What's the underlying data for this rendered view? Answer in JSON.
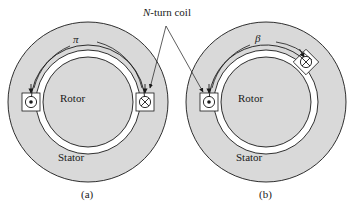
{
  "figure": {
    "type": "engineering-cross-section-diagram",
    "background_color": "#ffffff",
    "line_color": "#1a1a1a",
    "iron_fill_color": "#d9d9d9",
    "airgap_fill_color": "#ffffff"
  },
  "annotation": {
    "coil_label_prefix": "N",
    "coil_label_suffix": "-turn coil",
    "coil_label_full": "N-turn coil",
    "leader_apex": {
      "x": 166,
      "y": 26
    },
    "leader_targets": [
      {
        "x": 140,
        "y": 84,
        "panel": "a",
        "terminal": "cross"
      },
      {
        "x": 198,
        "y": 86,
        "panel": "b",
        "terminal": "dot"
      }
    ]
  },
  "panels": [
    {
      "id": "a",
      "caption": "(a)",
      "center": {
        "x": 88,
        "y": 102
      },
      "stator_outer_radius": 80,
      "stator_label": "Stator",
      "rotor_label": "Rotor",
      "rotor_radius": 45,
      "airgap_inner_radius": 45,
      "airgap_outer_radius": 52,
      "coil_arc_radius": 57,
      "angle_label": "π",
      "angle_value_radians": 3.14159,
      "angle_span_degrees": 180,
      "terminals": [
        {
          "symbol": "dot",
          "glyph": "⊙",
          "meaning": "current-out-of-page",
          "angle_degrees": 180,
          "x": 31,
          "y": 102
        },
        {
          "symbol": "cross",
          "glyph": "⊗",
          "meaning": "current-into-page",
          "angle_degrees": 0,
          "x": 145,
          "y": 102
        }
      ]
    },
    {
      "id": "b",
      "caption": "(b)",
      "center": {
        "x": 266,
        "y": 102
      },
      "stator_outer_radius": 80,
      "stator_label": "Stator",
      "rotor_label": "Rotor",
      "rotor_radius": 45,
      "airgap_inner_radius": 45,
      "airgap_outer_radius": 52,
      "coil_arc_radius": 57,
      "angle_label": "β",
      "angle_span_degrees": 135,
      "terminals": [
        {
          "symbol": "dot",
          "glyph": "⊙",
          "meaning": "current-out-of-page",
          "angle_degrees": 180,
          "x": 209,
          "y": 102
        },
        {
          "symbol": "cross",
          "glyph": "⊗",
          "meaning": "current-into-page",
          "angle_degrees": 45,
          "x": 306,
          "y": 63
        }
      ]
    }
  ]
}
